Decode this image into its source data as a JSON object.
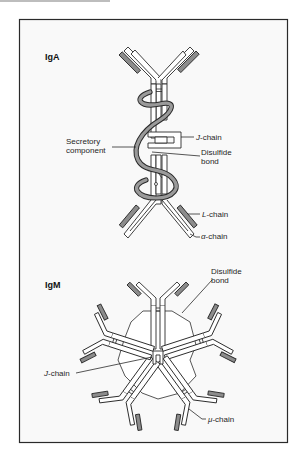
{
  "figure": {
    "panels": [
      {
        "id": "iga",
        "title": "IgA",
        "labels": {
          "secretory_component_line1": "Secretory",
          "secretory_component_line2": "component",
          "j_chain_prefix": "J",
          "j_chain_suffix": "-chain",
          "disulfide_line1": "Disulfide",
          "disulfide_line2": "bond",
          "l_chain_prefix": "L",
          "l_chain_suffix": "-chain",
          "alpha_chain_prefix": "α",
          "alpha_chain_suffix": "-chain"
        }
      },
      {
        "id": "igm",
        "title": "IgM",
        "labels": {
          "disulfide_line1": "Disulfide",
          "disulfide_line2": "bond",
          "j_chain_prefix": "J",
          "j_chain_suffix": "-chain",
          "mu_chain_prefix": "μ",
          "mu_chain_suffix": "-chain"
        }
      }
    ],
    "colors": {
      "background": "#f9f9f9",
      "line": "#2b2b2b",
      "light_chain_fill": "#8c8c8c",
      "heavy_chain_fill": "#ffffff"
    }
  }
}
